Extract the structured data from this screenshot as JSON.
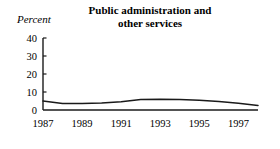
{
  "chart_data": {
    "type": "line",
    "title": "Public administration and other services",
    "title_lines": [
      "Public administration and",
      "other services"
    ],
    "ylabel": "Percent",
    "xlabel": "",
    "ylim": [
      0,
      40
    ],
    "xlim": [
      1987,
      1998
    ],
    "yticks": [
      0,
      10,
      20,
      30,
      40
    ],
    "ytick_labels": [
      "0",
      "10",
      "20",
      "30",
      "40"
    ],
    "xticks": [
      1987,
      1989,
      1991,
      1993,
      1995,
      1997
    ],
    "xtick_labels": [
      "1987",
      "1989",
      "1991",
      "1993",
      "1995",
      "1997"
    ],
    "grid": false,
    "legend": false,
    "series": [
      {
        "name": "Public administration and other services",
        "color": "#1a1a1a",
        "x": [
          1987,
          1988,
          1989,
          1990,
          1991,
          1992,
          1993,
          1994,
          1995,
          1996,
          1997,
          1998
        ],
        "values": [
          5.0,
          3.6,
          3.6,
          3.9,
          4.6,
          5.8,
          6.0,
          5.9,
          5.4,
          4.7,
          3.7,
          2.5
        ]
      }
    ]
  },
  "axes": {
    "axis_color": "#1a1a1a",
    "line_color": "#1a1a1a",
    "background": "#ffffff"
  }
}
